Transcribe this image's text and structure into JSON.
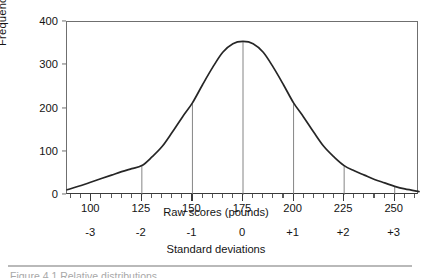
{
  "chart_data": {
    "type": "line",
    "title": "",
    "subtitle": "",
    "ylabel": "Frequency",
    "xlabel": "Raw scores (pounds)",
    "xlabel_secondary": "Standard deviations",
    "ylim": [
      0,
      400
    ],
    "xlim": [
      88,
      262
    ],
    "ytick_labels": [
      "0",
      "100",
      "200",
      "300",
      "400"
    ],
    "ytick_values": [
      0,
      100,
      200,
      300,
      400
    ],
    "xtick_labels": [
      "100",
      "125",
      "150",
      "175",
      "200",
      "225",
      "250"
    ],
    "xtick_values": [
      100,
      125,
      150,
      175,
      200,
      225,
      250
    ],
    "xtick_minor_step": 5,
    "sd_labels": [
      "-3",
      "-2",
      "-1",
      "0",
      "+1",
      "+2",
      "+3"
    ],
    "sd_values": [
      -3,
      -2,
      -1,
      0,
      1,
      2,
      3
    ],
    "grid": false,
    "legend": false,
    "mean": 175,
    "std_dev": 25,
    "peak_value": 355,
    "curve_color": "#262626",
    "frame_color": "#6f6f6f",
    "dropline_color": "#777777",
    "annotations": [
      {
        "x": 125,
        "y": 68,
        "type": "dropline"
      },
      {
        "x": 150,
        "y": 213,
        "type": "dropline"
      },
      {
        "x": 175,
        "y": 355,
        "type": "dropline"
      },
      {
        "x": 200,
        "y": 213,
        "type": "dropline"
      },
      {
        "x": 225,
        "y": 68,
        "type": "dropline"
      },
      {
        "x": 250,
        "y": 20,
        "type": "dropline"
      }
    ],
    "x": [
      88,
      95,
      100,
      105,
      110,
      115,
      120,
      125,
      130,
      135,
      140,
      145,
      150,
      155,
      160,
      165,
      170,
      175,
      180,
      185,
      190,
      195,
      200,
      205,
      210,
      215,
      220,
      225,
      230,
      235,
      240,
      245,
      250,
      255,
      262
    ],
    "values": [
      12,
      22,
      30,
      38,
      46,
      54,
      61,
      68,
      88,
      112,
      145,
      180,
      213,
      255,
      295,
      330,
      350,
      355,
      350,
      330,
      295,
      255,
      213,
      180,
      145,
      112,
      88,
      68,
      56,
      46,
      36,
      28,
      20,
      14,
      8
    ]
  },
  "caption": {
    "rule": "",
    "text": "Figure 4.1  Relative distributions"
  }
}
